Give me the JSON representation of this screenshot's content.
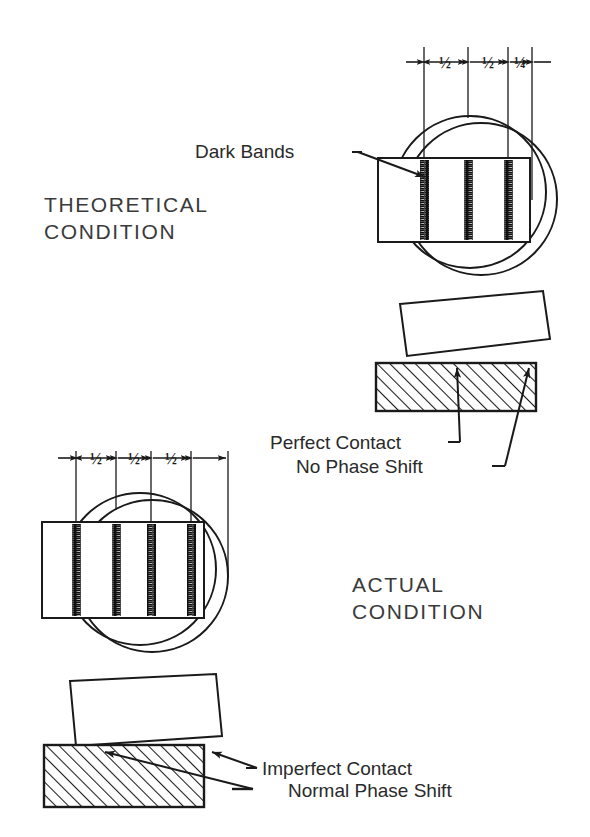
{
  "figure": {
    "background": "#ffffff",
    "ink": "#1a1a1a",
    "text_color": "#2a2a2a",
    "heading_color": "#3a3a3a"
  },
  "headings": {
    "theoretical_line1": "THEORETICAL",
    "theoretical_line2": "CONDITION",
    "actual_line1": "ACTUAL",
    "actual_line2": "CONDITION"
  },
  "labels": {
    "dark_bands": "Dark Bands",
    "perfect_contact": "Perfect Contact",
    "no_phase_shift": "No Phase Shift",
    "imperfect_contact": "Imperfect Contact",
    "normal_phase_shift": "Normal Phase Shift"
  },
  "dimensions": {
    "theoretical": [
      "½",
      "½",
      "¼"
    ],
    "actual": [
      "½",
      "½",
      "½"
    ]
  },
  "panels": {
    "theoretical_fringe": {
      "band_count": 3,
      "spacings": [
        "½",
        "½",
        "¼"
      ],
      "note": "unequal band spacing"
    },
    "actual_fringe": {
      "band_count": 4,
      "spacings": [
        "½",
        "½",
        "½"
      ],
      "note": "equal band spacing"
    },
    "theoretical_contact": {
      "contact": "Perfect Contact",
      "phase": "No Phase Shift",
      "hatch_angle_deg": 45
    },
    "actual_contact": {
      "contact": "Imperfect Contact",
      "phase": "Normal Phase Shift",
      "hatch_angle_deg": 45
    }
  }
}
